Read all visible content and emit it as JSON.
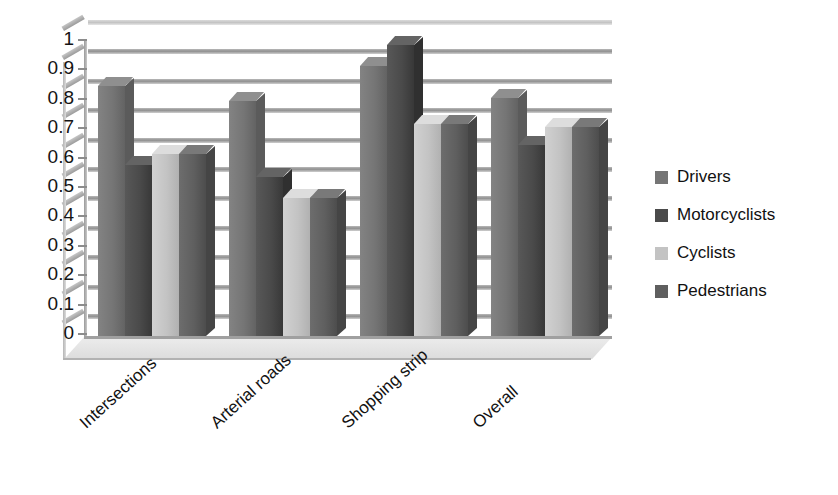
{
  "chart_data": {
    "type": "bar",
    "title": "",
    "xlabel": "",
    "ylabel": "",
    "ylim": [
      0,
      1
    ],
    "ytick_labels": [
      "1",
      "0.9",
      "0.8",
      "0.7",
      "0.6",
      "0.5",
      "0.4",
      "0.3",
      "0.2",
      "0.1",
      "0"
    ],
    "ytick_values": [
      1,
      0.9,
      0.8,
      0.7,
      0.6,
      0.5,
      0.4,
      0.3,
      0.2,
      0.1,
      0
    ],
    "grid": true,
    "legend_position": "right",
    "three_d": true,
    "categories": [
      "Intersections",
      "Arterial roads",
      "Shopping strip",
      "Overall"
    ],
    "series": [
      {
        "name": "Drivers",
        "color": "#757575",
        "values": [
          0.85,
          0.8,
          0.92,
          0.81
        ]
      },
      {
        "name": "Motorcyclists",
        "color": "#4a4a4a",
        "values": [
          0.58,
          0.54,
          0.99,
          0.65
        ]
      },
      {
        "name": "Cyclists",
        "color": "#c3c3c3",
        "values": [
          0.62,
          0.47,
          0.72,
          0.71
        ]
      },
      {
        "name": "Pedestrians",
        "color": "#5f5f5f",
        "values": [
          0.62,
          0.47,
          0.72,
          0.71
        ]
      }
    ]
  },
  "legend": {
    "items": [
      {
        "label": "Drivers",
        "color": "#757575"
      },
      {
        "label": "Motorcyclists",
        "color": "#4a4a4a"
      },
      {
        "label": "Cyclists",
        "color": "#c3c3c3"
      },
      {
        "label": "Pedestrians",
        "color": "#5f5f5f"
      }
    ]
  }
}
